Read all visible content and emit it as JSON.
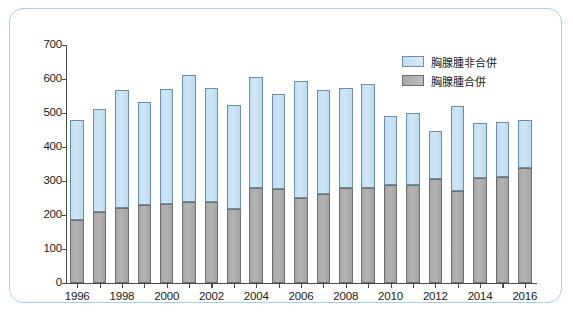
{
  "figure": {
    "frame_border_color": "#a9cfe6",
    "background_color": "#ffffff"
  },
  "legend": {
    "position": "top-right",
    "entries": [
      {
        "label": "胸腺腫非合併",
        "color": "#c2dff2",
        "swatch": "upper"
      },
      {
        "label": "胸腺腫合併",
        "color": "#aaaaaa",
        "swatch": "lower"
      }
    ]
  },
  "chart_data": {
    "type": "bar",
    "stacked": true,
    "title": "",
    "subtitle": "",
    "xlabel": "",
    "ylabel": "",
    "xlim": [
      1995.3,
      2016.7
    ],
    "ylim": [
      0,
      700
    ],
    "ytick_step": 100,
    "grid": false,
    "categories": [
      "1996",
      "1997",
      "1998",
      "1999",
      "2000",
      "2001",
      "2002",
      "2003",
      "2004",
      "2005",
      "2006",
      "2007",
      "2008",
      "2009",
      "2010",
      "2011",
      "2012",
      "2013",
      "2014",
      "2015",
      "2016"
    ],
    "xtick_labels": [
      "1996",
      "1998",
      "2000",
      "2002",
      "2004",
      "2006",
      "2008",
      "2010",
      "2012",
      "2014",
      "2016"
    ],
    "ytick_labels": [
      "0",
      "100",
      "200",
      "300",
      "400",
      "500",
      "600",
      "700"
    ],
    "series": [
      {
        "name": "胸腺腫合併",
        "color": "#aaaaaa",
        "values": [
          185,
          210,
          220,
          228,
          232,
          238,
          238,
          218,
          280,
          277,
          250,
          262,
          280,
          280,
          287,
          287,
          305,
          270,
          310,
          313,
          337
        ]
      },
      {
        "name": "胸腺腫非合併",
        "color": "#c2dff2",
        "values": [
          295,
          302,
          348,
          304,
          338,
          374,
          337,
          307,
          325,
          278,
          345,
          306,
          295,
          305,
          203,
          213,
          142,
          252,
          162,
          162,
          143
        ]
      }
    ],
    "totals": [
      480,
      512,
      568,
      532,
      570,
      612,
      575,
      525,
      605,
      555,
      595,
      568,
      575,
      585,
      490,
      500,
      447,
      522,
      472,
      475,
      480
    ]
  }
}
